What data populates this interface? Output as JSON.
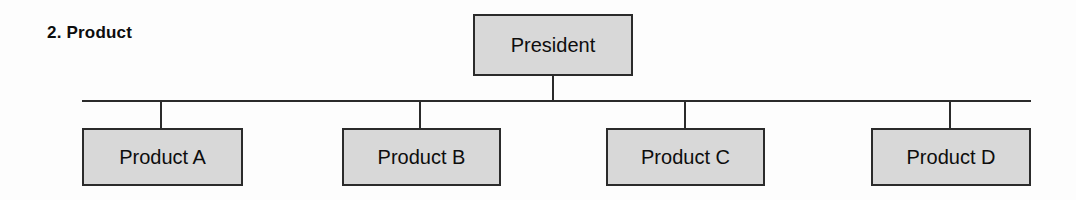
{
  "diagram": {
    "section_label": "2. Product",
    "type": "organizational-chart",
    "background_color": "#fdfdfd",
    "node_fill_color": "#d8d8d8",
    "node_border_color": "#2b2b2b",
    "connector_color": "#2b2b2b",
    "root": {
      "label": "President"
    },
    "children": [
      {
        "label": "Product A"
      },
      {
        "label": "Product B"
      },
      {
        "label": "Product C"
      },
      {
        "label": "Product D"
      }
    ]
  }
}
